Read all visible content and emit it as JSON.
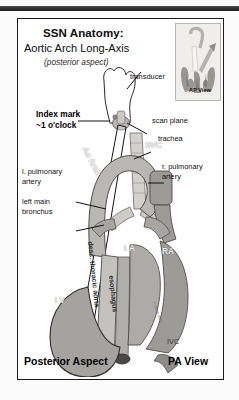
{
  "figure": {
    "title_line1": "SSN Anatomy:",
    "title_line2": "Aortic Arch Long-Axis",
    "title_line3": "(posterior aspect)",
    "footer_left": "Posterior Aspect",
    "footer_right": "PA View",
    "credit": "© Stone 2012"
  },
  "inset": {
    "caption": "AP View"
  },
  "callouts": {
    "transducer": "transducer",
    "index_mark_line1": "Index mark",
    "index_mark_line2": "~1 o'clock",
    "scan_plane": "scan plane",
    "trachea": "trachea",
    "r_pulmonary_line1": "r. pulmonary",
    "r_pulmonary_line2": "artery",
    "l_pulmonary_line1": "l. pulmonary",
    "l_pulmonary_line2": "artery",
    "left_main_line1": "left main",
    "left_main_line2": "bronchus"
  },
  "structures": {
    "ao_arch": "Ao Arch",
    "svc": "SVC",
    "la": "LA",
    "ra": "RA",
    "lv": "LV",
    "ivc": "IVC",
    "desc_thoracic_aorta": "desc. thoracic aorta",
    "esophagus": "esophagus"
  },
  "colors": {
    "frame": "#1a1a1a",
    "text": "#0d0d0d",
    "leader": "#111111",
    "inset_bg": "#efeeec",
    "vessel_grey": "#bdbdbd",
    "chamber_grey": "#a9a9a9"
  }
}
